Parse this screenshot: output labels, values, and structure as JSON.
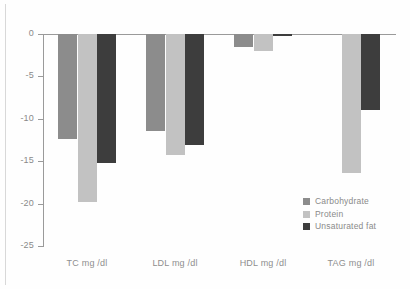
{
  "chart_data": {
    "type": "bar",
    "title": "",
    "xlabel": "",
    "ylabel": "",
    "categories": [
      "TC mg /dl",
      "LDL mg /dl",
      "HDL mg /dl",
      "TAG mg /dl"
    ],
    "series": [
      {
        "name": "Carbohydrate",
        "color": "#8c8c8c",
        "values": [
          -12.4,
          -11.4,
          -1.5,
          0.0
        ]
      },
      {
        "name": "Protein",
        "color": "#c2c2c2",
        "values": [
          -19.8,
          -14.3,
          -2.0,
          -16.4
        ]
      },
      {
        "name": "Unsaturated fat",
        "color": "#3d3d3d",
        "values": [
          -15.2,
          -13.1,
          -0.2,
          -9.0
        ]
      }
    ],
    "ylim": [
      -25,
      0
    ],
    "yticks": [
      0,
      -5,
      -10,
      -15,
      -20,
      -25
    ],
    "ytick_labels": [
      "0",
      "-5",
      "-10",
      "-15",
      "-20",
      "-25"
    ],
    "grid": false,
    "legend_position": "inside-lower-right",
    "axis_color": "#9a9a9a",
    "tick_label_color": "#8a8a8a",
    "background": "#fefefe"
  }
}
